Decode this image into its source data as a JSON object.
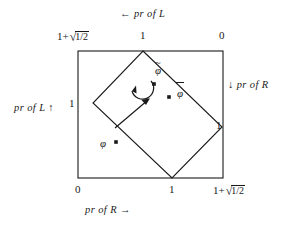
{
  "figure": {
    "axis_labels": {
      "top": "←  pr of L",
      "left": "pr of L  ↑",
      "right": "↓ pr of R",
      "bottom": "pr of R →"
    },
    "ticks": {
      "top_left": "1+√1/2",
      "top_left_base": "1+",
      "top_left_radicand": "1/2",
      "top_middle": "1",
      "top_right": "0",
      "left_upper": "1",
      "right_lower": "1",
      "bottom_left": "0",
      "bottom_middle": "1",
      "bottom_right": "1+√1/2",
      "bottom_right_base": "1+",
      "bottom_right_radicand": "1/2"
    },
    "points": [
      {
        "id": "phi-tilde",
        "label": "φ",
        "accent": "~",
        "x": 155,
        "y": 74
      },
      {
        "id": "phi-bar",
        "label": "φ",
        "accent": "¯",
        "x": 172,
        "y": 88
      },
      {
        "id": "phi",
        "label": "φ",
        "accent": "",
        "x": 104,
        "y": 142
      }
    ],
    "point_labels": {
      "phi_tilde": "φ",
      "phi_bar": "φ",
      "phi_plain": "φ"
    },
    "square": {
      "left": 78,
      "top": 51,
      "right": 223,
      "bottom": 178
    },
    "diamond": {
      "top": [
        143,
        51
      ],
      "right": [
        222,
        127
      ],
      "bottom": [
        172,
        178
      ],
      "left": [
        93,
        103
      ]
    },
    "colors": {
      "stroke": "#1a1a1a",
      "background": "#ffffff",
      "text": "#1a1a1a"
    },
    "arrows": {
      "rotation": "counterclockwise-curved-arrow",
      "translation": "straight-arrow-up-right"
    }
  }
}
